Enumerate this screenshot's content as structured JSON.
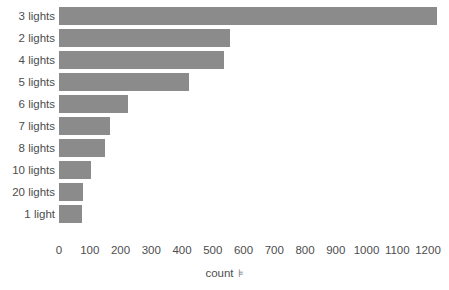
{
  "chart_data": {
    "type": "bar",
    "orientation": "horizontal",
    "title": "",
    "subtitle": "",
    "xlabel": "count",
    "ylabel": "",
    "categories": [
      "3 lights",
      "2 lights",
      "4 lights",
      "5 lights",
      "6 lights",
      "7 lights",
      "8 lights",
      "10 lights",
      "20 lights",
      "1 light"
    ],
    "values": [
      1230,
      557,
      537,
      424,
      225,
      166,
      150,
      104,
      78,
      75
    ],
    "series": [
      {
        "name": "count",
        "values": [
          1230,
          557,
          537,
          424,
          225,
          166,
          150,
          104,
          78,
          75
        ]
      }
    ],
    "xticks": [
      0,
      100,
      200,
      300,
      400,
      500,
      600,
      700,
      800,
      900,
      1000,
      1100,
      1200
    ],
    "xtick_labels": [
      "0",
      "100",
      "200",
      "300",
      "400",
      "500",
      "600",
      "700",
      "800",
      "900",
      "1000",
      "1100",
      "1200"
    ],
    "xlim": [
      0,
      1230
    ],
    "grid": false,
    "legend": false,
    "legend_position": "none",
    "bar_color": "#8b8b8b",
    "text_color": "#4d4d4d",
    "background_color": "#ffffff",
    "sort_indicator": "⊧"
  },
  "axis": {
    "x_title_text": "count",
    "x_sort_icon_glyph": "⊧"
  }
}
